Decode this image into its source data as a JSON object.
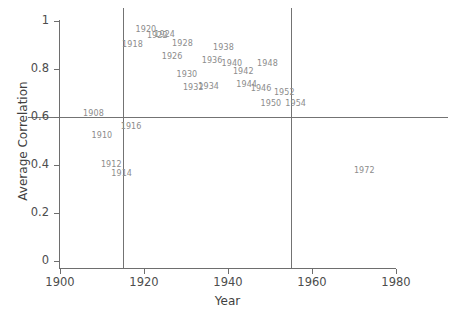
{
  "chart_data": {
    "type": "scatter",
    "title": "",
    "xlabel": "Year",
    "ylabel": "Average Correlation",
    "xlim": [
      1900,
      1980
    ],
    "ylim": [
      0,
      1
    ],
    "grid": false,
    "legend": null,
    "point_marker": "text-label",
    "x": [
      1908,
      1910,
      1912,
      1914,
      1916,
      1918,
      1920,
      1922,
      1924,
      1926,
      1928,
      1930,
      1932,
      1934,
      1936,
      1938,
      1940,
      1942,
      1944,
      1946,
      1948,
      1950,
      1952,
      1954,
      1972
    ],
    "labels": [
      "1908",
      "1910",
      "1912",
      "1914",
      "1916",
      "1918",
      "1920",
      "1922",
      "1924",
      "1926",
      "1928",
      "1930",
      "1932",
      "1934",
      "1936",
      "1938",
      "1940",
      "1942",
      "1944",
      "1946",
      "1948",
      "1950",
      "1952",
      "1954",
      "1972"
    ],
    "values": [
      0.605,
      0.515,
      0.395,
      0.375,
      0.555,
      0.895,
      0.955,
      0.915,
      0.915,
      0.855,
      0.895,
      0.775,
      0.725,
      0.725,
      0.835,
      0.875,
      0.815,
      0.795,
      0.735,
      0.725,
      0.815,
      0.665,
      0.695,
      0.665,
      0.375
    ],
    "xticks": [
      1900,
      1920,
      1940,
      1960,
      1980
    ],
    "xtick_labels": [
      "1900",
      "1920",
      "1940",
      "1960",
      "1980"
    ],
    "yticks": [
      0,
      0.2,
      0.4,
      0.6,
      0.8,
      1
    ],
    "ytick_labels": [
      "0",
      "0.2",
      "0.4",
      "0.6",
      "0.8",
      "1"
    ],
    "reference_lines": {
      "vertical": [
        1915,
        1955
      ],
      "horizontal": [
        0.6
      ]
    },
    "colors": {
      "axis": "#6e6e6e",
      "text": "#4d4d4d",
      "point_label": "#8c8c8c",
      "reference_line": "#737373",
      "background": "#ffffff"
    }
  }
}
